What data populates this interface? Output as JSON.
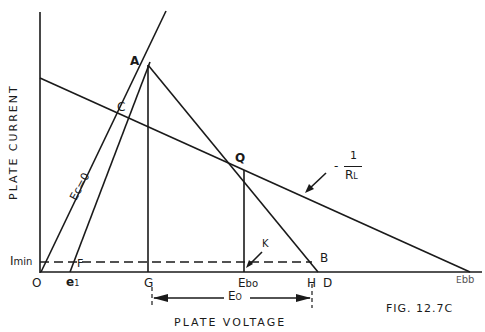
{
  "figure": {
    "caption": "FIG. 12.7C",
    "x_axis_label": "PLATE VOLTAGE",
    "y_axis_label": "PLATE CURRENT",
    "colors": {
      "ink": "#1a1a1a",
      "background": "#ffffff"
    }
  },
  "points": {
    "origin": "O",
    "A": "A",
    "B": "B",
    "C": "C",
    "Q": "Q",
    "F": "F",
    "G": "G",
    "H": "H",
    "D": "D",
    "K": "K",
    "e1_main": "e",
    "e1_sub": "1",
    "Ebo_main": "E",
    "Ebo_sub": "bo",
    "Ebb_main": "E",
    "Ebb_sub": "bb"
  },
  "annotations": {
    "imin_main": "I",
    "imin_sub": "min",
    "ec_zero": "Ec=0",
    "load_line_slope_num": "1",
    "load_line_slope_sign": "-",
    "load_line_slope_den": "R",
    "load_line_slope_den_sub": "L",
    "eo_main": "E",
    "eo_sub": "O",
    "tick_mark": "I"
  }
}
